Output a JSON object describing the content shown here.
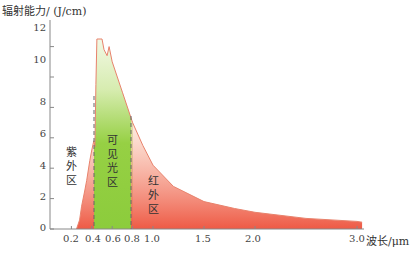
{
  "chart_data": {
    "type": "area",
    "title": "",
    "ylabel": "辐射能力/ (J/cm)",
    "xlabel": "波长/μm",
    "ylim": [
      0,
      12.5
    ],
    "xlim": [
      0,
      3.1
    ],
    "yticks": [
      0,
      2,
      4,
      6,
      8,
      10,
      12
    ],
    "xticks": [
      0.2,
      0.4,
      0.6,
      0.8,
      1.0,
      1.5,
      2.0,
      3.0
    ],
    "xtick_labels": [
      "0.2",
      "0.4",
      "0.6",
      "0.8",
      "1.0",
      "1.5",
      "2.0",
      "3.0"
    ],
    "grid": false,
    "series": [
      {
        "name": "太阳辐射光谱",
        "x": [
          0.25,
          0.28,
          0.3,
          0.33,
          0.35,
          0.38,
          0.4,
          0.42,
          0.43,
          0.44,
          0.45,
          0.5,
          0.52,
          0.55,
          0.57,
          0.6,
          0.7,
          0.8,
          0.9,
          1.0,
          1.2,
          1.5,
          1.8,
          2.0,
          2.5,
          3.0,
          3.05
        ],
        "values": [
          0,
          0.6,
          1.5,
          2.5,
          3.2,
          4.5,
          5.2,
          5.8,
          5.4,
          9.5,
          12.5,
          12.5,
          11.8,
          11.4,
          12.0,
          11.0,
          9.0,
          7.0,
          5.5,
          4.2,
          2.8,
          1.8,
          1.35,
          1.1,
          0.7,
          0.5,
          0.45
        ]
      }
    ],
    "regions": [
      {
        "name": "紫外区",
        "x_range": [
          0.2,
          0.4
        ],
        "color": "#ee5a45"
      },
      {
        "name": "可见光区",
        "x_range": [
          0.4,
          0.78
        ],
        "color": "#8ccc3c"
      },
      {
        "name": "红外区",
        "x_range": [
          0.78,
          3.05
        ],
        "color": "#ee5a45"
      }
    ],
    "dividers": [
      0.42,
      0.78
    ]
  },
  "labels": {
    "ylabel": "辐射能力/ (J/cm)",
    "xlabel": "波长/μm",
    "uv_region": [
      "紫",
      "外",
      "区"
    ],
    "visible_region": [
      "可",
      "见",
      "光",
      "区"
    ],
    "ir_region": [
      "红",
      "外",
      "区"
    ],
    "yticks": [
      "0",
      "2",
      "4",
      "6",
      "8",
      "10",
      "12"
    ],
    "xticks": [
      "0.2",
      "0.4",
      "0.6",
      "0.8",
      "1.0",
      "1.5",
      "2.0",
      "3.0"
    ]
  },
  "colors": {
    "curve": "#e8826c",
    "red_fill": "#ee5a45",
    "green_fill": "#8ccc3c",
    "axis": "#888888"
  }
}
